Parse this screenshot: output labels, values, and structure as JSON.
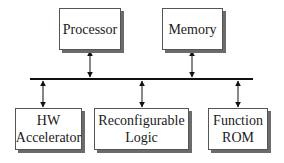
{
  "diagram": {
    "bus": {
      "label": "",
      "color": "#111111"
    },
    "top_blocks": [
      {
        "id": "processor",
        "lines": [
          "Processor"
        ]
      },
      {
        "id": "memory",
        "lines": [
          "Memory"
        ]
      }
    ],
    "bottom_blocks": [
      {
        "id": "hw-accelerator",
        "lines": [
          "HW",
          "Accelerator"
        ]
      },
      {
        "id": "reconfigurable-logic",
        "lines": [
          "Reconfigurable",
          "Logic"
        ]
      },
      {
        "id": "function-rom",
        "lines": [
          "Function",
          "ROM"
        ]
      }
    ],
    "connections": [
      {
        "from": "processor",
        "to": "bus",
        "type": "bidirectional-arrow"
      },
      {
        "from": "memory",
        "to": "bus",
        "type": "bidirectional-arrow"
      },
      {
        "from": "hw-accelerator",
        "to": "bus",
        "type": "bidirectional-arrow"
      },
      {
        "from": "reconfigurable-logic",
        "to": "bus",
        "type": "bidirectional-arrow"
      },
      {
        "from": "function-rom",
        "to": "bus",
        "type": "bidirectional-arrow"
      }
    ]
  }
}
